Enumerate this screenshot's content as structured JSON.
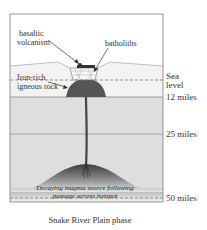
{
  "diagram": {
    "title": "Snake River Plain phase",
    "labels": {
      "basaltic_volcanism": [
        "basaltic",
        "volcanism"
      ],
      "batholiths": "batholiths",
      "iron_rich": [
        "Iron-rich",
        "igneous rock"
      ],
      "magma_source": [
        "Decaying magma source following",
        "passage across hotspot"
      ]
    },
    "depth_markers": {
      "sea_level": [
        "Sea",
        "level"
      ],
      "m12": "12 miles",
      "m25": "25 miles",
      "m50": "50 miles"
    },
    "colors": {
      "sky": "#ffffff",
      "upper_crust": "#f1f1f1",
      "crust": "#dcdcdc",
      "magma_dark": "#4a4a4a",
      "iron_rich": "#555555",
      "frame": "#8a8a8a",
      "dashed": "#777777"
    }
  }
}
